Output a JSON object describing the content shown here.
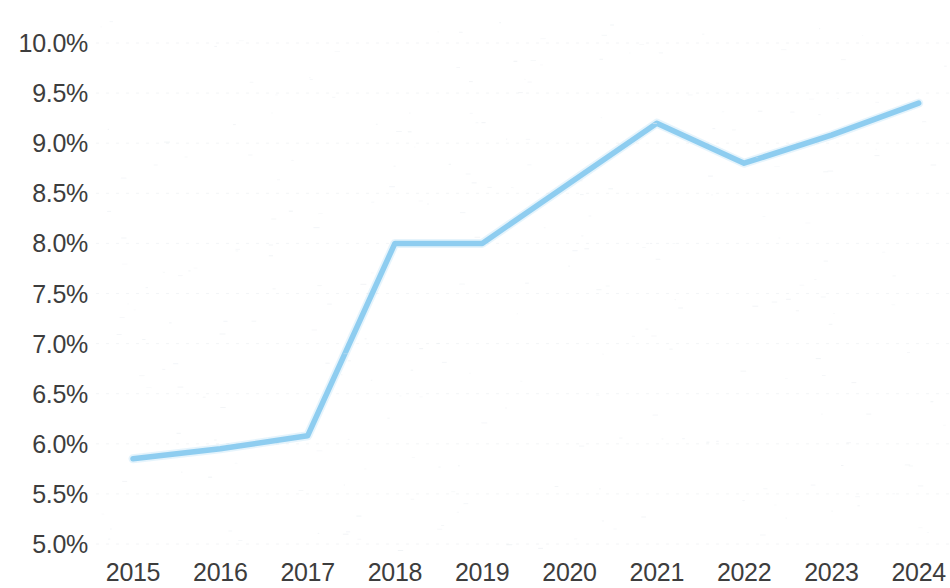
{
  "chart_data": {
    "type": "line",
    "title": "",
    "subtitle": "",
    "xlabel": "",
    "ylabel": "",
    "categories": [
      "2015",
      "2016",
      "2017",
      "2018",
      "2019",
      "2020",
      "2021",
      "2022",
      "2023",
      "2024"
    ],
    "x": [
      2015,
      2016,
      2017,
      2018,
      2019,
      2020,
      2021,
      2022,
      2023,
      2024
    ],
    "values": [
      5.85,
      5.95,
      6.08,
      8.0,
      8.0,
      8.6,
      9.2,
      8.8,
      9.08,
      9.4
    ],
    "series": [
      {
        "name": "",
        "color": "#8ecdf0",
        "values": [
          5.85,
          5.95,
          6.08,
          8.0,
          8.0,
          8.6,
          9.2,
          8.8,
          9.08,
          9.4
        ]
      }
    ],
    "ylim": [
      5.0,
      10.0
    ],
    "ytick_values": [
      5.0,
      5.5,
      6.0,
      6.5,
      7.0,
      7.5,
      8.0,
      8.5,
      9.0,
      9.5,
      10.0
    ],
    "ytick_labels": [
      "5.0%",
      "5.5%",
      "6.0%",
      "6.5%",
      "7.0%",
      "7.5%",
      "8.0%",
      "8.5%",
      "9.0%",
      "9.5%",
      "10.0%"
    ],
    "xtick_labels": [
      "2015",
      "2016",
      "2017",
      "2018",
      "2019",
      "2020",
      "2021",
      "2022",
      "2023",
      "2024"
    ],
    "grid": true,
    "grid_axis": "y",
    "legend": false,
    "legend_position": "none",
    "value_format": "percent",
    "background_color": "#ffffff",
    "axis_label_color": "#3d3d3d",
    "gridline_color": "#f2f4f6"
  },
  "chart": {
    "accent_color": "#8ecdf0",
    "line_color": "#8ecdf0",
    "background_color": "#ffffff"
  }
}
